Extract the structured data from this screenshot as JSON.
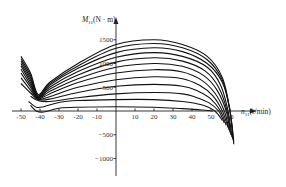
{
  "chart_data": {
    "type": "line",
    "title": "",
    "xlabel": "n11(r/min)",
    "ylabel": "M11(N·m)",
    "xlim": [
      -55,
      67
    ],
    "ylim": [
      -1300,
      2000
    ],
    "x_ticks": [
      -50,
      -40,
      -30,
      -20,
      -10,
      10,
      20,
      30,
      40,
      50,
      60
    ],
    "x_tick_labels": [
      "-50",
      "-40",
      "-30",
      "-20",
      "-10",
      "10",
      "20",
      "30",
      "40",
      "50",
      "60"
    ],
    "y_ticks": [
      1500,
      1000,
      500,
      -500,
      -1000
    ],
    "y_tick_labels": [
      "1500",
      "1000",
      "500",
      "−500",
      "−1000"
    ],
    "grid": false,
    "legend": null,
    "series": [
      {
        "name": "curve-1",
        "x": [
          -50,
          -45,
          -41,
          -35,
          -20,
          0,
          20,
          35,
          48,
          56,
          60,
          62
        ],
        "y": [
          1150,
          800,
          350,
          600,
          1000,
          1400,
          1500,
          1400,
          1150,
          700,
          0,
          -700
        ]
      },
      {
        "name": "curve-2",
        "x": [
          -50,
          -45,
          -41,
          -35,
          -20,
          0,
          20,
          35,
          48,
          56,
          60,
          62
        ],
        "y": [
          1100,
          750,
          320,
          570,
          950,
          1320,
          1420,
          1330,
          1080,
          650,
          0,
          -650
        ]
      },
      {
        "name": "curve-3",
        "x": [
          -50,
          -45,
          -41,
          -35,
          -20,
          0,
          20,
          35,
          48,
          56,
          60,
          61.5
        ],
        "y": [
          1050,
          700,
          300,
          540,
          900,
          1230,
          1330,
          1250,
          1000,
          600,
          0,
          -600
        ]
      },
      {
        "name": "curve-4",
        "x": [
          -50,
          -45,
          -41,
          -35,
          -20,
          0,
          20,
          35,
          48,
          55,
          59,
          61
        ],
        "y": [
          1000,
          650,
          290,
          500,
          830,
          1130,
          1230,
          1150,
          920,
          550,
          0,
          -550
        ]
      },
      {
        "name": "curve-5",
        "x": [
          -50,
          -45,
          -41,
          -35,
          -20,
          0,
          20,
          35,
          47,
          54,
          58.5,
          60.5
        ],
        "y": [
          950,
          600,
          280,
          460,
          760,
          1030,
          1120,
          1050,
          840,
          500,
          0,
          -500
        ]
      },
      {
        "name": "curve-6",
        "x": [
          -50,
          -45,
          -41,
          -35,
          -20,
          0,
          20,
          35,
          46,
          53,
          58,
          60
        ],
        "y": [
          880,
          550,
          270,
          410,
          680,
          920,
          1000,
          940,
          750,
          450,
          0,
          -450
        ]
      },
      {
        "name": "curve-7",
        "x": [
          -50,
          -45,
          -41,
          -35,
          -20,
          0,
          20,
          35,
          45,
          52,
          57,
          59.5
        ],
        "y": [
          800,
          500,
          260,
          360,
          600,
          800,
          870,
          820,
          650,
          380,
          0,
          -400
        ]
      },
      {
        "name": "curve-8",
        "x": [
          -50,
          -45,
          -41,
          -35,
          -20,
          0,
          20,
          35,
          44,
          51,
          56,
          59
        ],
        "y": [
          700,
          440,
          250,
          300,
          500,
          660,
          720,
          680,
          540,
          320,
          0,
          -350
        ]
      },
      {
        "name": "curve-9",
        "x": [
          -50,
          -45,
          -41,
          -35,
          -20,
          0,
          20,
          35,
          43,
          50,
          55,
          58
        ],
        "y": [
          580,
          380,
          240,
          250,
          390,
          520,
          560,
          520,
          420,
          250,
          0,
          -300
        ]
      },
      {
        "name": "curve-10",
        "x": [
          -45,
          -41,
          -35,
          -20,
          0,
          20,
          35,
          42,
          49,
          54,
          57
        ],
        "y": [
          310,
          220,
          200,
          280,
          360,
          390,
          360,
          290,
          170,
          0,
          -250
        ]
      },
      {
        "name": "curve-11",
        "x": [
          -46,
          -42,
          -38,
          -30,
          -20,
          0,
          20,
          35,
          45,
          52,
          56
        ],
        "y": [
          200,
          80,
          90,
          180,
          220,
          240,
          240,
          200,
          130,
          0,
          -200
        ]
      },
      {
        "name": "curve-12",
        "x": [
          -45,
          -42,
          -38,
          -30,
          -20,
          0,
          20,
          35,
          45,
          51
        ],
        "y": [
          120,
          0,
          -20,
          60,
          80,
          90,
          80,
          50,
          20,
          0
        ]
      }
    ]
  },
  "axes": {
    "y_axis_title_main": "M",
    "y_axis_title_sub": "11",
    "y_axis_title_unit": "(N · m)",
    "x_axis_title_main": "n",
    "x_axis_title_sub": "11",
    "x_axis_title_unit": "(r/min)"
  }
}
